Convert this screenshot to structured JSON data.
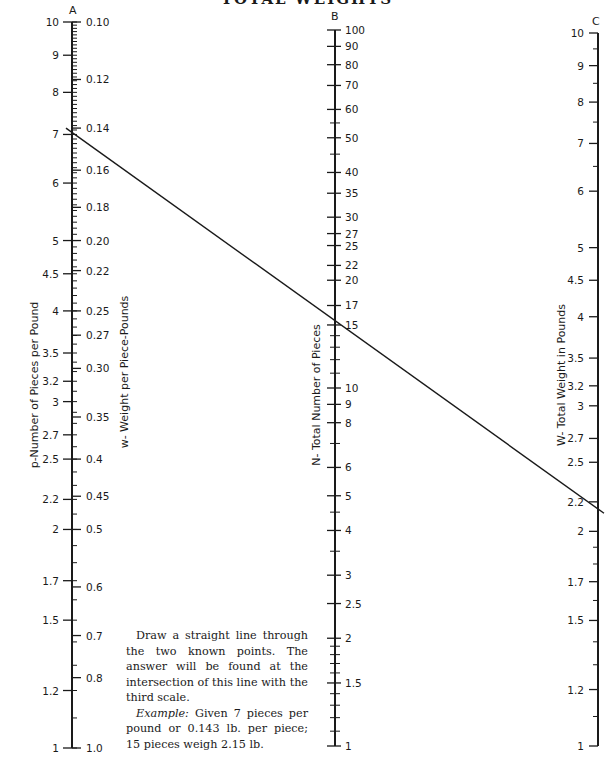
{
  "chart_data": {
    "type": "nomogram",
    "title": "TOTAL WEIGHTS",
    "scales": [
      {
        "id": "A",
        "letter": "A",
        "left_label": "p-Number of Pieces per Pound",
        "right_label": "w- Weight per Piece-Pounds",
        "left_ticks": [
          "10",
          "9",
          "8",
          "7",
          "6",
          "5",
          "4.5",
          "4",
          "3.5",
          "3.2",
          "3",
          "2.7",
          "2.5",
          "2.2",
          "2",
          "1.7",
          "1.5",
          "1.2",
          "1"
        ],
        "right_ticks": [
          "0.10",
          "0.12",
          "0.14",
          "0.16",
          "0.18",
          "0.20",
          "0.22",
          "0.25",
          "0.27",
          "0.30",
          "0.35",
          "0.4",
          "0.45",
          "0.5",
          "0.6",
          "0.7",
          "0.8",
          "1.0"
        ],
        "range": [
          1,
          10
        ]
      },
      {
        "id": "B",
        "letter": "B",
        "label": "N- Total Number of Pieces",
        "ticks": [
          "100",
          "90",
          "80",
          "70",
          "60",
          "50",
          "40",
          "35",
          "30",
          "27",
          "25",
          "22",
          "20",
          "17",
          "15",
          "10",
          "9",
          "8",
          "6",
          "5",
          "4",
          "3",
          "2.5",
          "2",
          "1.5",
          "1"
        ],
        "range": [
          1,
          100
        ]
      },
      {
        "id": "C",
        "letter": "C",
        "label": "W- Total Weight in Pounds",
        "ticks": [
          "10",
          "9",
          "8",
          "7",
          "6",
          "5",
          "4.5",
          "4",
          "3.5",
          "3.2",
          "3",
          "2.7",
          "2.5",
          "2.2",
          "2",
          "1.7",
          "1.5",
          "1.2",
          "1"
        ],
        "range": [
          1,
          10
        ]
      }
    ],
    "example_line": {
      "A_value": 7,
      "A_weight": 0.143,
      "B_value": 15,
      "C_value": 2.15
    }
  },
  "instructions": {
    "p1": "Draw a straight line through the two known points. The answer will be found at the intersection of this line with the third scale.",
    "example_label": "Example:",
    "example_text": " Given 7 pieces per pound or 0.143 lb. per piece; 15 pieces weigh 2.15 lb."
  }
}
